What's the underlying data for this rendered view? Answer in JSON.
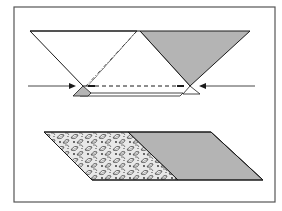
{
  "figure": {
    "colors": {
      "frame": "#555555",
      "outline": "#1a1a1a",
      "gray_fill": "#b4b4b4",
      "white_fill": "#ffffff",
      "print_dark": "#2a2a2a",
      "print_light": "#e8e8e8"
    },
    "top_step": {
      "description": "Two triangles overlapped, aligned with dash-dot fold line and dashed seam line; arrows indicate pressing together",
      "white_triangle": {
        "label": "white-triangle"
      },
      "gray_triangle": {
        "label": "gray-triangle"
      },
      "fold_line": {
        "style": "dash-dot"
      },
      "seam_line": {
        "style": "dashed"
      },
      "arrows": [
        {
          "direction": "right",
          "label": "left-arrow"
        },
        {
          "direction": "left",
          "label": "right-arrow"
        }
      ]
    },
    "bottom_step": {
      "description": "Resulting parallelogram: patterned (leaf print) left triangle joined to gray right part",
      "left_fabric": "leaf-print",
      "right_fabric": "gray"
    }
  }
}
